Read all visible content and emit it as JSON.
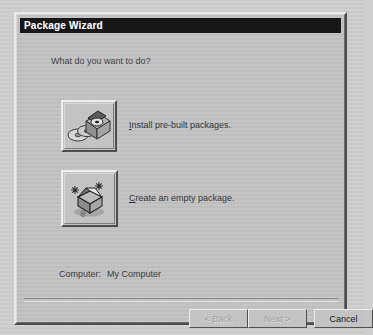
{
  "window": {
    "title": "Package Wizard"
  },
  "body": {
    "prompt": "What do you want to do?",
    "choices": [
      {
        "icon": "prebuilt-packages-icon",
        "accel": "I",
        "label_rest": "nstall pre-built packages."
      },
      {
        "icon": "empty-package-icon",
        "accel": "C",
        "label_rest": "reate an empty package."
      }
    ],
    "computer": {
      "label": "Computer:",
      "value": "My Computer"
    }
  },
  "footer": {
    "buttons": [
      {
        "name": "back-button",
        "label": "< Back",
        "enabled": false
      },
      {
        "name": "next-button",
        "label": "Next >",
        "enabled": false
      },
      {
        "name": "cancel-button",
        "label": "Cancel",
        "enabled": true
      }
    ]
  },
  "colors": {
    "dialog_face": "#c3c3c3",
    "titlebar_bg": "#141414",
    "titlebar_fg": "#ffffff",
    "text": "#1f1f1f",
    "disabled_text": "#9d9d9d",
    "page_bg": "#cfcfcf"
  }
}
